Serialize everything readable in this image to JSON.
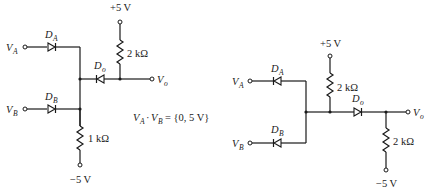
{
  "circuit_left": {
    "inputs": [
      {
        "name": "V",
        "sub": "A"
      },
      {
        "name": "V",
        "sub": "B"
      }
    ],
    "diodes": [
      {
        "name": "D",
        "sub": "A"
      },
      {
        "name": "D",
        "sub": "B"
      },
      {
        "name": "D",
        "sub": "o"
      }
    ],
    "supply_top": "+5 V",
    "supply_bottom": "−5 V",
    "resistor_top": "2 kΩ",
    "resistor_bottom": "1 kΩ",
    "output": {
      "name": "V",
      "sub": "o"
    },
    "condition": {
      "a_name": "V",
      "a_sub": "A",
      "dot": "·",
      "b_name": "V",
      "b_sub": "B",
      "value": "= {0, 5 V}"
    }
  },
  "circuit_right": {
    "inputs": [
      {
        "name": "V",
        "sub": "A"
      },
      {
        "name": "V",
        "sub": "B"
      }
    ],
    "diodes": [
      {
        "name": "D",
        "sub": "A"
      },
      {
        "name": "D",
        "sub": "B"
      },
      {
        "name": "D",
        "sub": "o"
      }
    ],
    "supply_top": "+5 V",
    "supply_bottom": "−5 V",
    "resistor_top": "2 kΩ",
    "resistor_bottom": "2 kΩ",
    "output": {
      "name": "V",
      "sub": "o"
    }
  }
}
